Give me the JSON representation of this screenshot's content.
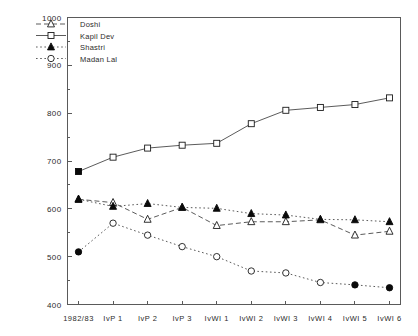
{
  "chart_data": {
    "type": "line",
    "title": "",
    "subtitle": "",
    "xlabel": "",
    "ylabel": "",
    "ylim": [
      400,
      1000
    ],
    "ytick_labels": [
      "400",
      "500",
      "600",
      "700",
      "800",
      "900",
      "1000"
    ],
    "ytick_values": [
      400,
      500,
      600,
      700,
      800,
      900,
      1000
    ],
    "yminor_values": [
      450,
      550,
      650,
      750,
      850,
      950
    ],
    "grid": false,
    "legend_position": "top-left",
    "categories": [
      "1982/83",
      "IvP 1",
      "IvP 2",
      "IvP 3",
      "IvWI 1",
      "IvWI 2",
      "IvWI 3",
      "IvWI 4",
      "IvWI 5",
      "IvWI 6"
    ],
    "series": [
      {
        "name": "Doshi",
        "marker": "triangle",
        "line_style": "dashed",
        "values": [
          620,
          613,
          578,
          603,
          565,
          573,
          573,
          577,
          545,
          553
        ],
        "filled_points": [
          0
        ]
      },
      {
        "name": "Kapil Dev",
        "marker": "square",
        "line_style": "solid",
        "values": [
          678,
          708,
          727,
          733,
          737,
          778,
          806,
          812,
          818,
          832
        ],
        "filled_points": [
          0
        ]
      },
      {
        "name": "Shastri",
        "marker": "triangle",
        "line_style": "dotted",
        "values": [
          620,
          605,
          611,
          603,
          601,
          590,
          587,
          578,
          577,
          573
        ],
        "filled_points": [
          0,
          1,
          2,
          3,
          4,
          5,
          6,
          7,
          8,
          9
        ]
      },
      {
        "name": "Madan Lal",
        "marker": "circle",
        "line_style": "dotted",
        "values": [
          510,
          570,
          545,
          521,
          500,
          470,
          466,
          446,
          441,
          435
        ],
        "filled_points": [
          0,
          8,
          9
        ]
      }
    ]
  },
  "legend": {
    "entries": [
      {
        "label": "Doshi"
      },
      {
        "label": "Kapil Dev"
      },
      {
        "label": "Shastri"
      },
      {
        "label": "Madan Lal"
      }
    ]
  },
  "colors": {
    "axis": "#5a5a5a",
    "line": "#3d3d3d",
    "marker_fill": "#0a0a0a",
    "marker_open": "#ffffff",
    "text": "#2b2b2b",
    "background": "#ffffff"
  }
}
